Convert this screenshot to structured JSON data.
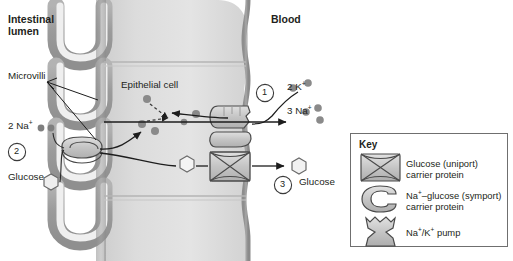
{
  "diagram": {
    "title_left": "Intestinal\nlumen",
    "labels": {
      "intestinal_lumen_line1": "Intestinal",
      "intestinal_lumen_line2": "lumen",
      "blood": "Blood",
      "microvilli": "Microvilli",
      "epithelial_cell": "Epithelial cell",
      "two_na": "2 Na",
      "two_na_charge": "+",
      "glucose_left": "Glucose",
      "glucose_right": "Glucose",
      "two_k": "2 K",
      "two_k_charge": "+",
      "three_na": "3 Na",
      "three_na_charge": "+"
    },
    "step_markers": [
      {
        "id": "step-1",
        "label": "1"
      },
      {
        "id": "step-2",
        "label": "2"
      },
      {
        "id": "step-3",
        "label": "3"
      }
    ]
  },
  "key": {
    "title": "Key",
    "items": [
      {
        "icon": "glucose-uniport-carrier-icon",
        "line1": "Glucose (uniport)",
        "line2": "carrier protein"
      },
      {
        "icon": "na-glucose-symport-carrier-icon",
        "line1_a": "Na",
        "line1_sup": "+",
        "line1_b": "–glucose (symport)",
        "line2": "carrier protein"
      },
      {
        "icon": "na-k-pump-icon",
        "line1_a": "Na",
        "line1_sup_a": "+",
        "line1_mid": "/K",
        "line1_sup_b": "+",
        "line1_b": " pump",
        "line2": ""
      }
    ]
  },
  "colors": {
    "membrane": "#9a9a9a",
    "cytoplasm": "#d9d9d9",
    "cytoplasm_light": "#e6e6e6",
    "protein_fill": "#c6c6c6",
    "ion_dot": "#808080",
    "outline": "#3a3a3a",
    "text": "#231f20",
    "key_border": "#6f6f6f",
    "background": "#ffffff"
  }
}
